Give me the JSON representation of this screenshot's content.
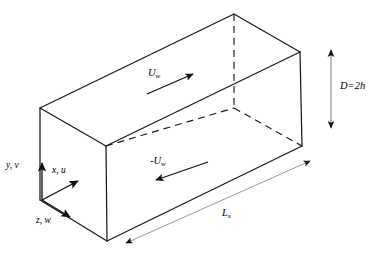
{
  "figure": {
    "background_color": "#ffffff",
    "line_color": "#1a1a1a",
    "dimension_line_color": "#8c8c8c"
  },
  "geometry": {
    "description": "Rectangular box (duct) drawn in oblique projection",
    "top_face_vertices": [
      [
        40,
        108
      ],
      [
        234,
        14
      ],
      [
        300,
        52
      ],
      [
        106,
        146
      ]
    ],
    "bottom_face_vertices": [
      [
        40,
        200
      ],
      [
        234,
        108
      ],
      [
        302,
        146
      ],
      [
        107,
        241
      ]
    ],
    "hidden_edges_dashed": [
      [
        [
          106,
          146
        ],
        [
          234,
          108
        ]
      ],
      [
        [
          234,
          108
        ],
        [
          302,
          146
        ]
      ],
      [
        [
          234,
          14
        ],
        [
          234,
          108
        ]
      ]
    ]
  },
  "labels": {
    "axis_y": {
      "text": "y, v",
      "var": "y",
      "component": "v"
    },
    "axis_x": {
      "text": "x, u",
      "var": "x",
      "component": "u"
    },
    "axis_z": {
      "text": "z, w",
      "var": "z",
      "component": "w"
    },
    "top_wall_velocity": {
      "base": "U",
      "subscript": "w"
    },
    "bottom_wall_velocity": {
      "base": "-U",
      "subscript": "w"
    },
    "height_dimension": {
      "text": "D=2h"
    },
    "length_dimension": {
      "base": "L",
      "subscript": "x"
    }
  },
  "arrows": {
    "axis_y": {
      "name": "y-axis-arrow",
      "from": [
        42,
        200
      ],
      "to": [
        42,
        160
      ],
      "direction": "up"
    },
    "axis_x": {
      "name": "x-axis-arrow",
      "from": [
        42,
        200
      ],
      "to": [
        80,
        180
      ],
      "direction": "up-right"
    },
    "axis_z": {
      "name": "z-axis-arrow",
      "from": [
        42,
        200
      ],
      "to": [
        72,
        218
      ],
      "direction": "down-right"
    },
    "top_velocity": {
      "name": "top-wall-velocity-arrow",
      "from": [
        148,
        94
      ],
      "to": [
        196,
        73
      ],
      "direction": "up-right"
    },
    "bottom_velocity": {
      "name": "bottom-wall-velocity-arrow",
      "from": [
        206,
        163
      ],
      "to": [
        152,
        181
      ],
      "direction": "down-left"
    },
    "height": {
      "name": "height-dimension-arrow",
      "from": [
        331,
        44
      ],
      "to": [
        331,
        133
      ],
      "direction": "double-vertical"
    },
    "length": {
      "name": "length-dimension-arrow",
      "from": [
        120,
        246
      ],
      "to": [
        316,
        158
      ],
      "direction": "double-diagonal"
    }
  }
}
